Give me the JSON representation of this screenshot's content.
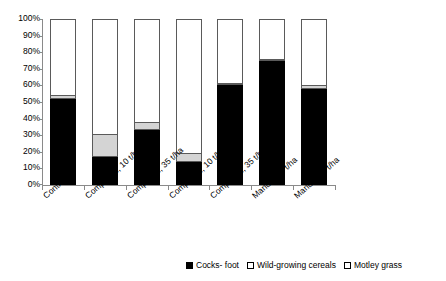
{
  "chart_data": {
    "type": "bar",
    "stacked": true,
    "stacked_mode": "percent",
    "title": "",
    "xlabel": "",
    "ylabel": "",
    "ylim": [
      0,
      100
    ],
    "yticks": [
      "0%",
      "10%",
      "20%",
      "30%",
      "40%",
      "50%",
      "60%",
      "70%",
      "80%",
      "90%",
      "100%"
    ],
    "ytick_values": [
      0,
      10,
      20,
      30,
      40,
      50,
      60,
      70,
      80,
      90,
      100
    ],
    "grid": false,
    "legend_position": "bottom",
    "categories": [
      "Control",
      "Compost 1, 10 t/ha",
      "Compost 1, 35 t/ha",
      "Compost 2, 10 t/ha",
      "Compost 2, 35 t/ha",
      "Manure 10 t/ha",
      "Manure 35 t/ha"
    ],
    "series": [
      {
        "name": "Cocks- foot",
        "color": "#000000",
        "values": [
          52,
          17,
          33,
          14,
          60,
          75,
          58
        ]
      },
      {
        "name": "Wild-growing cereals",
        "color": "#d4d4d4",
        "values": [
          2,
          14,
          5,
          5,
          1,
          1,
          2
        ]
      },
      {
        "name": "Motley grass",
        "color": "#ffffff",
        "values": [
          46,
          69,
          62,
          81,
          39,
          24,
          40
        ]
      }
    ]
  },
  "legend": {
    "items": [
      {
        "label": "Cocks- foot",
        "swatch": "filled"
      },
      {
        "label": "Wild-growing cereals",
        "swatch": "open"
      },
      {
        "label": "Motley grass",
        "swatch": "open"
      }
    ]
  }
}
